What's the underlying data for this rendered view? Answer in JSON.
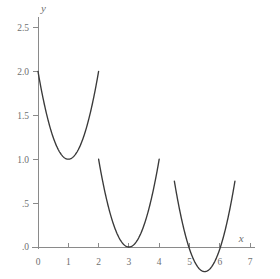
{
  "figure": {
    "background_color": "#ffffff",
    "curve_color": "#3a3a3a",
    "axis_color": "#8a8a8a",
    "tick_label_color": "#6f6f6f",
    "width": 280,
    "height": 279
  },
  "axes": {
    "x_axis_name": "x",
    "y_axis_name": "y",
    "x_ticks": [
      {
        "value": 0,
        "label": "0"
      },
      {
        "value": 1,
        "label": "1"
      },
      {
        "value": 2,
        "label": "2"
      },
      {
        "value": 3,
        "label": "3"
      },
      {
        "value": 4,
        "label": "4"
      },
      {
        "value": 5,
        "label": "5"
      },
      {
        "value": 6,
        "label": "6"
      },
      {
        "value": 7,
        "label": "7"
      }
    ],
    "y_ticks": [
      {
        "value": 2.5,
        "label": "2.5"
      },
      {
        "value": 2.0,
        "label": "2.0"
      },
      {
        "value": 1.5,
        "label": "1.5"
      },
      {
        "value": 1.0,
        "label": "1.0"
      },
      {
        "value": 0.5,
        "label": ".5"
      },
      {
        "value": 0.0,
        "label": ".0"
      }
    ]
  },
  "chart_data": {
    "type": "line",
    "title": "",
    "subtitle": "",
    "xlabel": "x",
    "ylabel": "y",
    "xlim": [
      0,
      7.15
    ],
    "ylim": [
      -0.35,
      2.62
    ],
    "grid": false,
    "legend": null,
    "legend_position": "none",
    "annotations": [],
    "x_tick_values": [
      0,
      1,
      2,
      3,
      4,
      5,
      6,
      7
    ],
    "y_tick_values": [
      0.0,
      0.5,
      1.0,
      1.5,
      2.0,
      2.5
    ],
    "series": [
      {
        "name": "arc-1",
        "vertex": [
          1.0,
          1.0
        ],
        "x_start": 0.0,
        "x_end": 2.0,
        "y_start": 2.0,
        "y_end": 2.0,
        "leading_coefficient": 1.0,
        "x": [
          0.0,
          0.25,
          0.5,
          0.75,
          1.0,
          1.25,
          1.5,
          1.75,
          2.0
        ],
        "values": [
          2.0,
          1.5625,
          1.25,
          1.0625,
          1.0,
          1.0625,
          1.25,
          1.5625,
          2.0
        ]
      },
      {
        "name": "arc-2",
        "vertex": [
          3.0,
          0.0
        ],
        "x_start": 2.0,
        "x_end": 4.0,
        "y_start": 1.0,
        "y_end": 1.0,
        "leading_coefficient": 1.0,
        "x": [
          2.0,
          2.25,
          2.5,
          2.75,
          3.0,
          3.25,
          3.5,
          3.75,
          4.0
        ],
        "values": [
          1.0,
          0.5625,
          0.25,
          0.0625,
          0.0,
          0.0625,
          0.25,
          0.5625,
          1.0
        ]
      },
      {
        "name": "arc-3",
        "vertex": [
          5.5,
          -0.28
        ],
        "x_start": 4.5,
        "x_end": 6.5,
        "y_start": 0.75,
        "y_end": 0.75,
        "leading_coefficient": 1.03,
        "x": [
          4.5,
          4.75,
          5.0,
          5.25,
          5.5,
          5.75,
          6.0,
          6.25,
          6.5
        ],
        "values": [
          0.75,
          0.3006,
          0.0225,
          -0.2156,
          -0.28,
          -0.2156,
          0.0225,
          0.3006,
          0.75
        ]
      }
    ]
  }
}
